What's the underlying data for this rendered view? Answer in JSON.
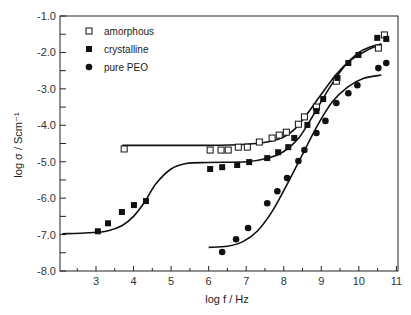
{
  "chart_data": {
    "type": "scatter",
    "title": "",
    "xlabel": "log f / Hz",
    "ylabel": "log σ / Scm⁻¹",
    "xlim": [
      2.1,
      11
    ],
    "ylim": [
      -8.0,
      -1.0
    ],
    "x_ticks": [
      "3",
      "4",
      "5",
      "6",
      "7",
      "8",
      "9",
      "10",
      "11"
    ],
    "y_ticks": [
      "-1.0",
      "-2.0",
      "-3.0",
      "-4.0",
      "-5.0",
      "-6.0",
      "-7.0",
      "-8.0"
    ],
    "grid": false,
    "legend_position": "upper left",
    "series": [
      {
        "name": "amorphous",
        "marker": "open-square",
        "points": [
          [
            3.75,
            -4.65
          ],
          [
            6.04,
            -4.68
          ],
          [
            6.33,
            -4.68
          ],
          [
            6.52,
            -4.68
          ],
          [
            6.79,
            -4.6
          ],
          [
            7.03,
            -4.6
          ],
          [
            7.35,
            -4.46
          ],
          [
            7.69,
            -4.35
          ],
          [
            7.88,
            -4.27
          ],
          [
            8.07,
            -4.19
          ],
          [
            8.39,
            -3.97
          ],
          [
            8.55,
            -3.77
          ],
          [
            8.87,
            -3.5
          ],
          [
            9.4,
            -2.79
          ],
          [
            10.52,
            -1.88
          ],
          [
            10.68,
            -1.52
          ]
        ],
        "fit_curve": [
          [
            3.7,
            -4.55
          ],
          [
            6.0,
            -4.55
          ],
          [
            7.0,
            -4.52
          ],
          [
            7.6,
            -4.45
          ],
          [
            8.0,
            -4.32
          ],
          [
            8.3,
            -4.1
          ],
          [
            8.6,
            -3.72
          ],
          [
            9.0,
            -3.15
          ],
          [
            9.4,
            -2.6
          ],
          [
            9.8,
            -2.2
          ],
          [
            10.2,
            -1.95
          ],
          [
            10.6,
            -1.77
          ]
        ]
      },
      {
        "name": "crystalline",
        "marker": "filled-square",
        "points": [
          [
            3.05,
            -6.91
          ],
          [
            3.32,
            -6.69
          ],
          [
            3.69,
            -6.38
          ],
          [
            4.01,
            -6.19
          ],
          [
            4.33,
            -6.08
          ],
          [
            6.04,
            -5.2
          ],
          [
            6.36,
            -5.15
          ],
          [
            6.76,
            -5.09
          ],
          [
            7.08,
            -5.01
          ],
          [
            7.56,
            -4.9
          ],
          [
            7.85,
            -4.74
          ],
          [
            8.12,
            -4.6
          ],
          [
            8.28,
            -4.35
          ],
          [
            8.63,
            -3.99
          ],
          [
            8.87,
            -3.61
          ],
          [
            9.05,
            -3.28
          ],
          [
            9.43,
            -2.7
          ],
          [
            9.72,
            -2.29
          ],
          [
            9.99,
            -2.07
          ],
          [
            10.49,
            -1.6
          ],
          [
            10.73,
            -1.63
          ]
        ],
        "fit_curve": [
          [
            2.1,
            -6.98
          ],
          [
            2.8,
            -6.95
          ],
          [
            3.3,
            -6.9
          ],
          [
            3.7,
            -6.75
          ],
          [
            4.0,
            -6.5
          ],
          [
            4.3,
            -6.1
          ],
          [
            4.6,
            -5.6
          ],
          [
            5.0,
            -5.2
          ],
          [
            5.4,
            -5.05
          ],
          [
            6.0,
            -5.02
          ],
          [
            7.0,
            -5.0
          ],
          [
            7.6,
            -4.9
          ],
          [
            8.0,
            -4.72
          ],
          [
            8.4,
            -4.35
          ],
          [
            8.8,
            -3.7
          ],
          [
            9.2,
            -3.0
          ],
          [
            9.6,
            -2.4
          ],
          [
            10.0,
            -2.0
          ],
          [
            10.3,
            -1.85
          ],
          [
            10.6,
            -1.77
          ]
        ]
      },
      {
        "name": "pure PEO",
        "marker": "filled-circle",
        "points": [
          [
            6.36,
            -7.48
          ],
          [
            6.73,
            -7.13
          ],
          [
            7.05,
            -6.82
          ],
          [
            7.56,
            -6.14
          ],
          [
            7.83,
            -5.81
          ],
          [
            8.09,
            -5.45
          ],
          [
            8.39,
            -4.98
          ],
          [
            8.55,
            -4.68
          ],
          [
            8.87,
            -4.21
          ],
          [
            9.11,
            -3.88
          ],
          [
            9.4,
            -3.39
          ],
          [
            9.72,
            -3.12
          ],
          [
            9.96,
            -2.9
          ],
          [
            10.52,
            -2.43
          ],
          [
            10.73,
            -2.29
          ]
        ],
        "fit_curve": [
          [
            6.0,
            -7.35
          ],
          [
            6.5,
            -7.32
          ],
          [
            6.9,
            -7.2
          ],
          [
            7.3,
            -6.9
          ],
          [
            7.7,
            -6.35
          ],
          [
            8.1,
            -5.6
          ],
          [
            8.5,
            -4.8
          ],
          [
            8.9,
            -4.0
          ],
          [
            9.3,
            -3.35
          ],
          [
            9.7,
            -2.95
          ],
          [
            10.1,
            -2.72
          ],
          [
            10.6,
            -2.62
          ]
        ]
      }
    ]
  },
  "legend": {
    "items": [
      {
        "label": "amorphous"
      },
      {
        "label": "crystalline"
      },
      {
        "label": "pure PEO"
      }
    ]
  }
}
